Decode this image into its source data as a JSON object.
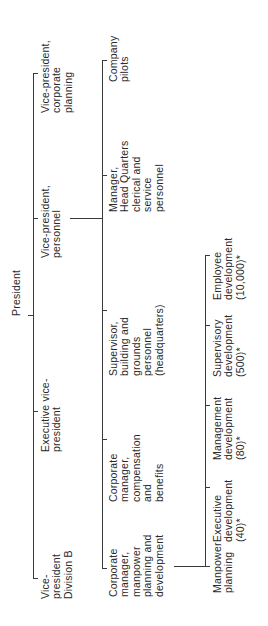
{
  "root": {
    "label": "President"
  },
  "level1": [
    {
      "id": "vp-corporate-planning",
      "lines": [
        "Vice-president,",
        "corporate",
        "planning"
      ]
    },
    {
      "id": "vp-personnel",
      "lines": [
        "Vice-president,",
        "personnel"
      ]
    },
    {
      "id": "executive-vp",
      "lines": [
        "Executive vice-",
        "president"
      ]
    },
    {
      "id": "vp-division-b",
      "lines": [
        "Vice-",
        "president",
        "Division B"
      ]
    }
  ],
  "level2": [
    {
      "id": "company-pilots",
      "lines": [
        "Company",
        "pilots"
      ]
    },
    {
      "id": "manager-hq",
      "lines": [
        "Manager,",
        "Head Quarters",
        "clerical and",
        "service",
        "personnel"
      ]
    },
    {
      "id": "supervisor-building",
      "lines": [
        "Supervisor,",
        "building and",
        "grounds",
        "personnel",
        "(headquarters)"
      ]
    },
    {
      "id": "corp-manager-compensation",
      "lines": [
        "Corporate",
        "manager,",
        "compensation",
        "and",
        "benefits"
      ]
    },
    {
      "id": "corp-manager-manpower",
      "lines": [
        "Corporate",
        "manager,",
        "manpower",
        "planning and",
        "development"
      ]
    }
  ],
  "level3": [
    {
      "id": "employee-development",
      "lines": [
        "Employee",
        "development",
        "(10,000)*"
      ]
    },
    {
      "id": "supervisory-development",
      "lines": [
        "Supervisory",
        "development",
        "(500)*"
      ]
    },
    {
      "id": "management-development",
      "lines": [
        "Management",
        "development",
        "(80)*"
      ]
    },
    {
      "id": "executive-development",
      "lines": [
        "Executive",
        "development",
        "(40)*"
      ]
    },
    {
      "id": "manpower-planning",
      "lines": [
        "Manpower",
        "planning"
      ]
    }
  ]
}
